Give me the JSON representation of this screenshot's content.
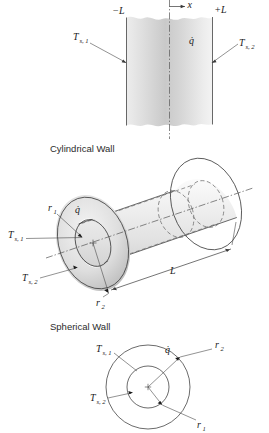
{
  "figure": {
    "type": "technical-diagram",
    "title_visible": false,
    "panels": [
      {
        "id": "plane-wall",
        "caption": "",
        "labels": {
          "left_boundary": "−L",
          "right_boundary": "+L",
          "axis": "x",
          "surface_temp_left": "T",
          "surface_temp_left_sub": "s, 1",
          "surface_temp_right": "T",
          "surface_temp_right_sub": "s, 2",
          "generation": "q̇"
        }
      },
      {
        "id": "cylindrical-wall",
        "caption": "Cylindrical Wall",
        "labels": {
          "inner_radius": "r",
          "inner_radius_sub": "1",
          "outer_radius": "r",
          "outer_radius_sub": "2",
          "length": "L",
          "surface_temp_inner": "T",
          "surface_temp_inner_sub": "s, 1",
          "surface_temp_outer": "T",
          "surface_temp_outer_sub": "s, 2",
          "generation": "q̇"
        }
      },
      {
        "id": "spherical-wall",
        "caption": "Spherical Wall",
        "labels": {
          "inner_radius": "r",
          "inner_radius_sub": "1",
          "outer_radius": "r",
          "outer_radius_sub": "2",
          "surface_temp_inner": "T",
          "surface_temp_inner_sub": "s, 1",
          "surface_temp_outer": "T",
          "surface_temp_outer_sub": "s, 2",
          "generation": "q̇"
        }
      }
    ],
    "colors": {
      "background": "#ffffff",
      "outline": "#3a3a3a",
      "hidden_line": "#6b6b6b",
      "label_text": "#1a1a1a",
      "caption_text": "#2b2b2b",
      "shade_light": "#f2f2f2",
      "shade_mid": "#d8d8d8",
      "shade_dark": "#b9b9b9"
    }
  }
}
